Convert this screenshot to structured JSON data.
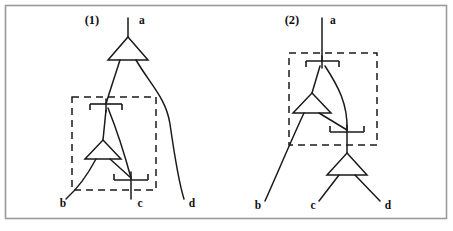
{
  "figure": {
    "background_color": "#ffffff",
    "line_color": "#1a1a1a",
    "frame_color": "#9a9a9a",
    "width": 453,
    "height": 231
  },
  "diagrams": [
    {
      "id": "diagram-1",
      "number_label": "(1)",
      "number_pos": {
        "x": 92,
        "y": 24
      },
      "terminals": [
        {
          "name": "a",
          "label": "a",
          "x": 139,
          "y": 24,
          "role": "output-top"
        },
        {
          "name": "b",
          "label": "b",
          "x": 63,
          "y": 204,
          "role": "input-bottom"
        },
        {
          "name": "c",
          "label": "c",
          "x": 134,
          "y": 204,
          "role": "input-bottom"
        },
        {
          "name": "d",
          "label": "d",
          "x": 184,
          "y": 204,
          "role": "input-bottom"
        }
      ],
      "gates": [
        {
          "name": "gate-top",
          "shape": "triangle-up",
          "cx": 128,
          "cy": 46
        },
        {
          "name": "gate-inner",
          "shape": "triangle-up",
          "cx": 103,
          "cy": 149
        }
      ],
      "junctions": [
        {
          "name": "junction-upper",
          "x": 106,
          "y": 104,
          "tick": "down"
        },
        {
          "name": "junction-lower",
          "x": 131,
          "y": 180,
          "tick": "up"
        }
      ],
      "dashed_box": {
        "x": 72,
        "y": 97,
        "width": 84,
        "height": 93
      }
    },
    {
      "id": "diagram-2",
      "number_label": "(2)",
      "number_pos": {
        "x": 292,
        "y": 24
      },
      "terminals": [
        {
          "name": "a",
          "label": "a",
          "x": 330,
          "y": 24,
          "role": "output-top"
        },
        {
          "name": "b",
          "label": "b",
          "x": 262,
          "y": 206,
          "role": "input-bottom"
        },
        {
          "name": "c",
          "label": "c",
          "x": 317,
          "y": 206,
          "role": "input-bottom"
        },
        {
          "name": "d",
          "label": "d",
          "x": 383,
          "y": 206,
          "role": "input-bottom"
        }
      ],
      "gates": [
        {
          "name": "gate-inner",
          "shape": "triangle-up",
          "cx": 312,
          "cy": 102
        },
        {
          "name": "gate-bottom",
          "shape": "triangle-up",
          "cx": 347,
          "cy": 163
        }
      ],
      "junctions": [
        {
          "name": "junction-upper",
          "x": 322,
          "y": 61,
          "tick": "down"
        },
        {
          "name": "junction-lower",
          "x": 347,
          "y": 132,
          "tick": "up"
        }
      ],
      "dashed_box": {
        "x": 289,
        "y": 53,
        "width": 88,
        "height": 92
      }
    }
  ],
  "labels": {
    "diagram1_number": "(1)",
    "diagram1_a": "a",
    "diagram1_b": "b",
    "diagram1_c": "c",
    "diagram1_d": "d",
    "diagram2_number": "(2)",
    "diagram2_a": "a",
    "diagram2_b": "b",
    "diagram2_c": "c",
    "diagram2_d": "d"
  }
}
